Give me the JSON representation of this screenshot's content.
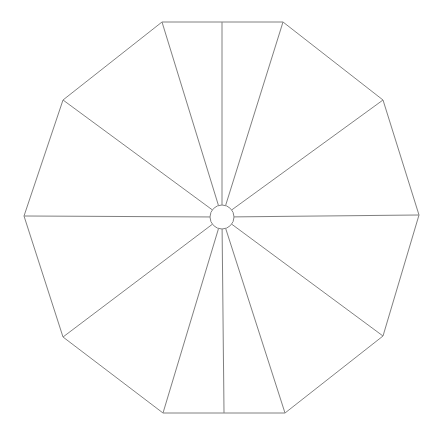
{
  "figure": {
    "background_color": "#ffffff",
    "stroke_color": "#808080",
    "stroke_width": 1,
    "canvas": {
      "width": 441,
      "height": 442
    }
  },
  "chart_data": {
    "type": "scatter",
    "xlabel": "",
    "ylabel": "",
    "grid": false,
    "legend_position": "none",
    "xlim": [
      0,
      441
    ],
    "ylim": [
      0,
      442
    ],
    "shape": {
      "name": "decagon",
      "sides": 10,
      "center": {
        "x": 222,
        "y": 217
      },
      "vertices": [
        {
          "label": "top-left",
          "x": 162,
          "y": 22
        },
        {
          "label": "top-right",
          "x": 283,
          "y": 22
        },
        {
          "label": "upper-right",
          "x": 383,
          "y": 100
        },
        {
          "label": "right",
          "x": 419,
          "y": 215
        },
        {
          "label": "lower-right",
          "x": 383,
          "y": 336
        },
        {
          "label": "bottom-right",
          "x": 285,
          "y": 413
        },
        {
          "label": "bottom-left",
          "x": 163,
          "y": 413
        },
        {
          "label": "lower-left",
          "x": 63,
          "y": 337
        },
        {
          "label": "left",
          "x": 24,
          "y": 216
        },
        {
          "label": "upper-left",
          "x": 63,
          "y": 100
        }
      ]
    },
    "hub": {
      "name": "center-hub",
      "center": {
        "x": 222,
        "y": 217
      },
      "radius": 12,
      "fill": "#ffffff",
      "stroke": "#808080"
    },
    "spokes": {
      "count": 12,
      "endpoints": [
        {
          "label": "spoke-to-top-left",
          "x": 162,
          "y": 22
        },
        {
          "label": "spoke-to-top-mid",
          "x": 222,
          "y": 22
        },
        {
          "label": "spoke-to-top-right",
          "x": 283,
          "y": 22
        },
        {
          "label": "spoke-to-upper-right",
          "x": 383,
          "y": 100
        },
        {
          "label": "spoke-to-right",
          "x": 419,
          "y": 215
        },
        {
          "label": "spoke-to-lower-right",
          "x": 383,
          "y": 336
        },
        {
          "label": "spoke-to-bottom-right",
          "x": 285,
          "y": 413
        },
        {
          "label": "spoke-to-bottom-mid",
          "x": 224,
          "y": 413
        },
        {
          "label": "spoke-to-bottom-left",
          "x": 163,
          "y": 413
        },
        {
          "label": "spoke-to-lower-left",
          "x": 63,
          "y": 337
        },
        {
          "label": "spoke-to-left",
          "x": 24,
          "y": 216
        },
        {
          "label": "spoke-to-upper-left",
          "x": 63,
          "y": 100
        }
      ]
    }
  }
}
